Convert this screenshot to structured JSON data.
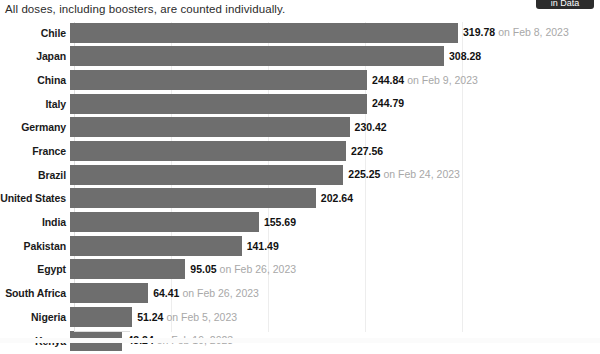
{
  "header": {
    "subtitle": "All doses, including boosters, are counted individually.",
    "top_button_label": "in Data"
  },
  "chart_data": {
    "type": "bar",
    "orientation": "horizontal",
    "title": "",
    "subtitle": "All doses, including boosters, are counted individually.",
    "xlabel": "",
    "ylabel": "",
    "xlim": [
      0,
      340
    ],
    "grid": true,
    "gridlines": [
      80,
      160,
      240,
      320
    ],
    "legend": "none",
    "bar_color": "#6e6e6e",
    "categories": [
      "Chile",
      "Japan",
      "China",
      "Italy",
      "Germany",
      "France",
      "Brazil",
      "United States",
      "India",
      "Pakistan",
      "Egypt",
      "South Africa",
      "Nigeria",
      "Kenya"
    ],
    "values": [
      319.78,
      308.28,
      244.84,
      244.79,
      230.42,
      227.56,
      225.25,
      202.64,
      155.69,
      141.49,
      95.05,
      64.41,
      51.24,
      43.24
    ],
    "rows": [
      {
        "label": "Chile",
        "value": 319.78,
        "value_text": "319.78",
        "date": "on Feb 8, 2023"
      },
      {
        "label": "Japan",
        "value": 308.28,
        "value_text": "308.28",
        "date": ""
      },
      {
        "label": "China",
        "value": 244.84,
        "value_text": "244.84",
        "date": "on Feb 9, 2023"
      },
      {
        "label": "Italy",
        "value": 244.79,
        "value_text": "244.79",
        "date": ""
      },
      {
        "label": "Germany",
        "value": 230.42,
        "value_text": "230.42",
        "date": ""
      },
      {
        "label": "France",
        "value": 227.56,
        "value_text": "227.56",
        "date": ""
      },
      {
        "label": "Brazil",
        "value": 225.25,
        "value_text": "225.25",
        "date": "on Feb 24, 2023"
      },
      {
        "label": "United States",
        "value": 202.64,
        "value_text": "202.64",
        "date": ""
      },
      {
        "label": "India",
        "value": 155.69,
        "value_text": "155.69",
        "date": ""
      },
      {
        "label": "Pakistan",
        "value": 141.49,
        "value_text": "141.49",
        "date": ""
      },
      {
        "label": "Egypt",
        "value": 95.05,
        "value_text": "95.05",
        "date": "on Feb 26, 2023"
      },
      {
        "label": "South Africa",
        "value": 64.41,
        "value_text": "64.41",
        "date": "on Feb 26, 2023"
      },
      {
        "label": "Nigeria",
        "value": 51.24,
        "value_text": "51.24",
        "date": "on Feb 5, 2023"
      },
      {
        "label": "Kenya",
        "value": 43.24,
        "value_text": "43.24",
        "date": "on Feb 19, 2023"
      }
    ]
  }
}
